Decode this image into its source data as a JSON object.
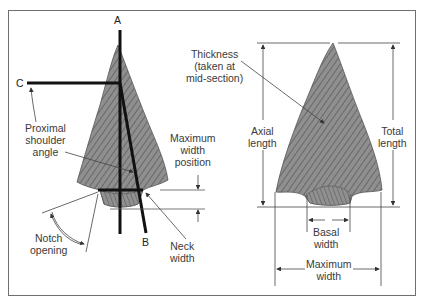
{
  "left_figure": {
    "point_labels": {
      "a": "A",
      "b": "B",
      "c": "C"
    },
    "labels": {
      "proximal_shoulder_angle": "Proximal\nshoulder\nangle",
      "maximum_width_position": "Maximum\nwidth\nposition",
      "notch_opening": "Notch\nopening",
      "neck_width": "Neck\nwidth"
    }
  },
  "right_figure": {
    "labels": {
      "thickness": "Thickness\n(taken at\nmid-section)",
      "axial_length": "Axial\nlength",
      "total_length": "Total\nlength",
      "basal_width": "Basal\nwidth",
      "maximum_width": "Maximum\nwidth"
    }
  },
  "colors": {
    "frame": "#6f6f6f",
    "stone_fill": "#8c8c8c",
    "stone_texture": "#4a4a4a",
    "measure_line": "#111111",
    "thin_line": "#555555",
    "text": "#3a3a3a"
  }
}
